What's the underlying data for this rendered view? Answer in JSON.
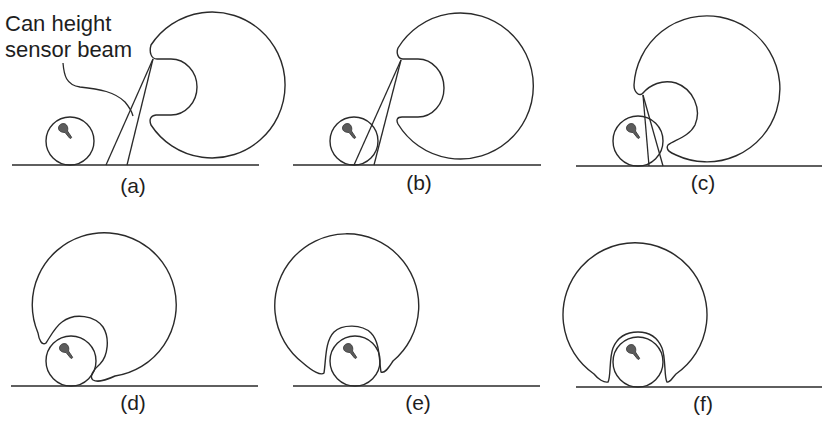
{
  "figure": {
    "annotation": {
      "line1": "Can height",
      "line2": "sensor beam"
    },
    "panels": [
      {
        "id": "a",
        "label": "(a)",
        "stage": "can approaching, sensor beam ahead of robot"
      },
      {
        "id": "b",
        "label": "(b)",
        "stage": "sensor beam intersects can"
      },
      {
        "id": "c",
        "label": "(c)",
        "stage": "robot rotating over can"
      },
      {
        "id": "d",
        "label": "(d)",
        "stage": "can entering gripper notch"
      },
      {
        "id": "e",
        "label": "(e)",
        "stage": "can nearly captured"
      },
      {
        "id": "f",
        "label": "(f)",
        "stage": "can fully captured"
      }
    ],
    "colors": {
      "stroke": "#2a2a2a",
      "can_mark": "#5c5c5c",
      "background": "#ffffff"
    }
  }
}
